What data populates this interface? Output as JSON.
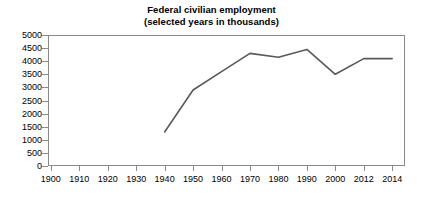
{
  "chart_data": {
    "type": "line",
    "title": "Federal civilian employment",
    "subtitle": "(selected years in thousands)",
    "xlabel": "",
    "ylabel": "",
    "categories": [
      "1900",
      "1910",
      "1920",
      "1930",
      "1940",
      "1950",
      "1960",
      "1970",
      "1980",
      "1990",
      "2000",
      "2012",
      "2014"
    ],
    "values": [
      null,
      null,
      null,
      null,
      1300,
      2900,
      3600,
      4300,
      4150,
      4450,
      3500,
      4100,
      4100
    ],
    "series": [
      {
        "name": "Federal civilian employment",
        "values": [
          null,
          null,
          null,
          null,
          1300,
          2900,
          3600,
          4300,
          4150,
          4450,
          3500,
          4100,
          4100
        ],
        "color": "#595959"
      }
    ],
    "ylim": [
      0,
      5000
    ],
    "yticks": [
      0,
      500,
      1000,
      1500,
      2000,
      2500,
      3000,
      3500,
      4000,
      4500,
      5000
    ],
    "ytick_labels": [
      "0",
      "500",
      "1000",
      "1500",
      "2000",
      "2500",
      "3000",
      "3500",
      "4000",
      "4500",
      "5000"
    ],
    "grid": false,
    "legend": false,
    "legend_position": "none",
    "axis_color": "#8a8a8a",
    "background_color": "#ffffff"
  }
}
